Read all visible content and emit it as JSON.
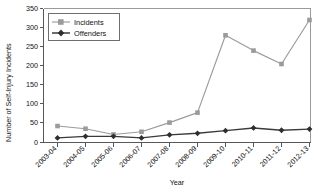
{
  "chart_data": {
    "type": "line",
    "title": "",
    "xlabel": "Year",
    "ylabel": "Number of Self-Injury Incidents",
    "categories": [
      "2003-04",
      "2004-05",
      "2005-06",
      "2006-07",
      "2007-08",
      "2008-09",
      "2009-10",
      "2010-11",
      "2011-12",
      "2012-13"
    ],
    "series": [
      {
        "name": "Incidents",
        "color": "#9b9b9b",
        "marker": "square",
        "values": [
          43,
          36,
          21,
          28,
          52,
          78,
          280,
          240,
          205,
          320
        ]
      },
      {
        "name": "Offenders",
        "color": "#2e2e2e",
        "marker": "diamond",
        "values": [
          12,
          16,
          16,
          12,
          20,
          24,
          31,
          38,
          32,
          35
        ]
      }
    ],
    "ylim": [
      0,
      350
    ],
    "yticks": [
      0,
      50,
      100,
      150,
      200,
      250,
      300,
      350
    ],
    "ytick_labels": [
      "0",
      "50",
      "100",
      "150",
      "200",
      "250",
      "300",
      "350"
    ],
    "grid": false,
    "legend_position": "top-left"
  },
  "legend": {
    "entries": [
      {
        "label": "Incidents"
      },
      {
        "label": "Offenders"
      }
    ]
  }
}
